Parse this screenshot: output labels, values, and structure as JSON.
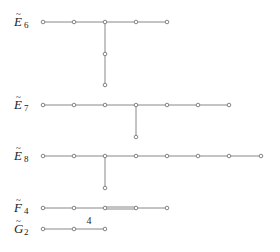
{
  "diagrams": [
    {
      "id": "E6",
      "label": "E",
      "tilde": "~",
      "subscript": "6",
      "label_pos": [
        14,
        26
      ],
      "nodes": [
        [
          43,
          22
        ],
        [
          74,
          22
        ],
        [
          105,
          22
        ],
        [
          136,
          22
        ],
        [
          167,
          22
        ],
        [
          105,
          54
        ],
        [
          105,
          85
        ]
      ],
      "edges": [
        [
          0,
          1
        ],
        [
          1,
          2
        ],
        [
          2,
          3
        ],
        [
          3,
          4
        ],
        [
          2,
          5
        ],
        [
          5,
          6
        ]
      ],
      "double_edges": []
    },
    {
      "id": "E7",
      "label": "E",
      "tilde": "~",
      "subscript": "7",
      "label_pos": [
        14,
        109
      ],
      "nodes": [
        [
          43,
          105
        ],
        [
          74,
          105
        ],
        [
          105,
          105
        ],
        [
          136,
          105
        ],
        [
          167,
          105
        ],
        [
          198,
          105
        ],
        [
          229,
          105
        ],
        [
          136,
          137
        ]
      ],
      "edges": [
        [
          0,
          1
        ],
        [
          1,
          2
        ],
        [
          2,
          3
        ],
        [
          3,
          4
        ],
        [
          4,
          5
        ],
        [
          5,
          6
        ],
        [
          3,
          7
        ]
      ],
      "double_edges": []
    },
    {
      "id": "E8",
      "label": "E",
      "tilde": "~",
      "subscript": "8",
      "label_pos": [
        14,
        160
      ],
      "nodes": [
        [
          43,
          156
        ],
        [
          74,
          156
        ],
        [
          105,
          156
        ],
        [
          136,
          156
        ],
        [
          167,
          156
        ],
        [
          198,
          156
        ],
        [
          229,
          156
        ],
        [
          261,
          156
        ],
        [
          105,
          188
        ]
      ],
      "edges": [
        [
          0,
          1
        ],
        [
          1,
          2
        ],
        [
          2,
          3
        ],
        [
          3,
          4
        ],
        [
          4,
          5
        ],
        [
          5,
          6
        ],
        [
          6,
          7
        ],
        [
          2,
          8
        ]
      ],
      "double_edges": []
    },
    {
      "id": "F4",
      "label": "F",
      "tilde": "~",
      "subscript": "4",
      "label_pos": [
        14,
        212
      ],
      "nodes": [
        [
          43,
          208
        ],
        [
          74,
          208
        ],
        [
          105,
          208
        ],
        [
          136,
          208
        ],
        [
          167,
          208
        ]
      ],
      "edges": [
        [
          0,
          1
        ],
        [
          1,
          2
        ],
        [
          3,
          4
        ]
      ],
      "double_edges": [
        [
          2,
          3
        ]
      ]
    },
    {
      "id": "G2",
      "label": "G",
      "tilde": "~",
      "subscript": "2",
      "label_pos": [
        14,
        233
      ],
      "nodes": [
        [
          43,
          229
        ],
        [
          74,
          229
        ],
        [
          105,
          229
        ]
      ],
      "edges": [
        [
          0,
          1
        ],
        [
          1,
          2
        ]
      ],
      "double_edges": [],
      "edge_labels": [
        {
          "edge": [
            1,
            2
          ],
          "text": "4",
          "pos": [
            89,
            224
          ]
        }
      ]
    }
  ]
}
